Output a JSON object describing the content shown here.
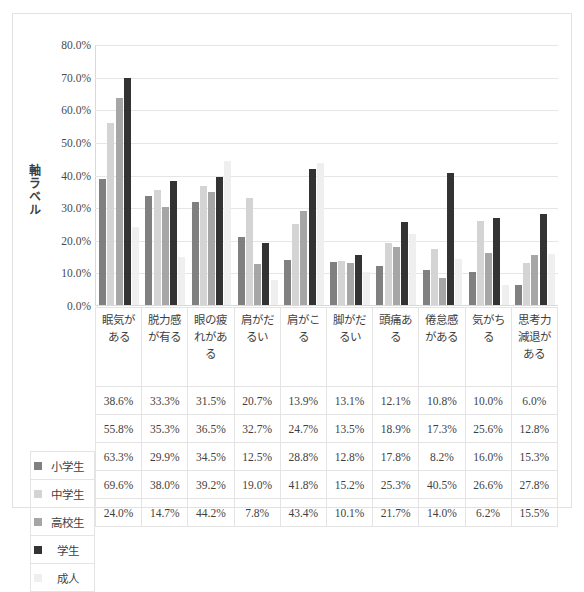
{
  "chart_data": {
    "type": "bar",
    "title": "",
    "xlabel": "",
    "ylabel": "軸ラベル",
    "ylim": [
      0,
      80
    ],
    "ytick_labels": [
      "80.0%",
      "70.0%",
      "60.0%",
      "50.0%",
      "40.0%",
      "30.0%",
      "20.0%",
      "10.0%",
      "0.0%"
    ],
    "ytick_values": [
      80,
      70,
      60,
      50,
      40,
      30,
      20,
      10,
      0
    ],
    "grid": true,
    "legend_position": "table-left",
    "categories": [
      "眠気がある",
      "脱力感が有る",
      "眼の疲れがある",
      "肩がだるい",
      "肩がこる",
      "脚がだるい",
      "頭痛ある",
      "倦怠感がある",
      "気がちる",
      "思考力減退がある"
    ],
    "series": [
      {
        "name": "小学生",
        "color": "#808080",
        "values": [
          38.6,
          33.3,
          31.5,
          20.7,
          13.9,
          13.1,
          12.1,
          10.8,
          10.0,
          6.0
        ],
        "labels": [
          "38.6%",
          "33.3%",
          "31.5%",
          "20.7%",
          "13.9%",
          "13.1%",
          "12.1%",
          "10.8%",
          "10.0%",
          "6.0%"
        ]
      },
      {
        "name": "中学生",
        "color": "#d4d4d4",
        "values": [
          55.8,
          35.3,
          36.5,
          32.7,
          24.7,
          13.5,
          18.9,
          17.3,
          25.6,
          12.8
        ],
        "labels": [
          "55.8%",
          "35.3%",
          "36.5%",
          "32.7%",
          "24.7%",
          "13.5%",
          "18.9%",
          "17.3%",
          "25.6%",
          "12.8%"
        ]
      },
      {
        "name": "高校生",
        "color": "#a6a6a6",
        "values": [
          63.3,
          29.9,
          34.5,
          12.5,
          28.8,
          12.8,
          17.8,
          8.2,
          16.0,
          15.3
        ],
        "labels": [
          "63.3%",
          "29.9%",
          "34.5%",
          "12.5%",
          "28.8%",
          "12.8%",
          "17.8%",
          "8.2%",
          "16.0%",
          "15.3%"
        ]
      },
      {
        "name": "学生",
        "color": "#333333",
        "values": [
          69.6,
          38.0,
          39.2,
          19.0,
          41.8,
          15.2,
          25.3,
          40.5,
          26.6,
          27.8
        ],
        "labels": [
          "69.6%",
          "38.0%",
          "39.2%",
          "19.0%",
          "41.8%",
          "15.2%",
          "25.3%",
          "40.5%",
          "26.6%",
          "27.8%"
        ]
      },
      {
        "name": "成人",
        "color": "#efefef",
        "values": [
          24.0,
          14.7,
          44.2,
          7.8,
          43.4,
          10.1,
          21.7,
          14.0,
          6.2,
          15.5
        ],
        "labels": [
          "24.0%",
          "14.7%",
          "44.2%",
          "7.8%",
          "43.4%",
          "10.1%",
          "21.7%",
          "14.0%",
          "6.2%",
          "15.5%"
        ]
      }
    ]
  }
}
